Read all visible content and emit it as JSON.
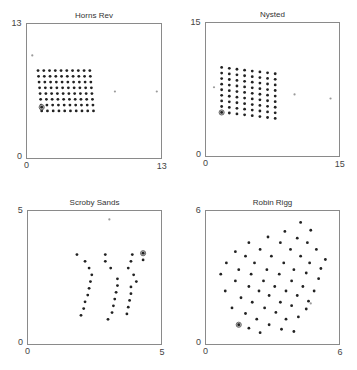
{
  "chart_data": [
    {
      "type": "scatter",
      "title": "Horns Rev",
      "xlabel": "",
      "ylabel": "",
      "xlim": [
        0,
        13
      ],
      "ylim": [
        0,
        13
      ],
      "xticks": [
        "0",
        "13"
      ],
      "yticks": [
        "0",
        "13"
      ],
      "grid": false,
      "box": {
        "left": 26,
        "top": 23,
        "size": 136
      },
      "series": [
        {
          "name": "turbines",
          "color": "#222222",
          "generator": {
            "rows": 8,
            "cols": 10,
            "x0": 1.15,
            "y0": 8.45,
            "dx": 0.55,
            "dy": -0.55,
            "row_shift": 0.05
          }
        },
        {
          "name": "highlighted turbine",
          "color": "#222222",
          "points": [
            [
              1.5,
              4.95
            ]
          ],
          "ring": true
        },
        {
          "name": "reference points",
          "color": "#9a9a9a",
          "points": [
            [
              0.6,
              9.9
            ],
            [
              8.5,
              6.45
            ],
            [
              12.5,
              6.45
            ]
          ]
        }
      ]
    },
    {
      "type": "scatter",
      "title": "Nysted",
      "xlabel": "",
      "ylabel": "",
      "xlim": [
        0,
        15
      ],
      "ylim": [
        0,
        15
      ],
      "xticks": [
        "0",
        "15"
      ],
      "yticks": [
        "0",
        "15"
      ],
      "grid": false,
      "box": {
        "left": 205,
        "top": 22,
        "size": 135
      },
      "series": [
        {
          "name": "turbines",
          "color": "#222222",
          "generator": {
            "rows": 9,
            "cols": 8,
            "x0": 1.85,
            "y0": 9.95,
            "dx": 0.85,
            "dy": -0.62,
            "col_shift": -0.1
          }
        },
        {
          "name": "highlighted turbine",
          "color": "#222222",
          "points": [
            [
              1.85,
              4.95
            ]
          ],
          "ring": true
        },
        {
          "name": "reference points",
          "color": "#9a9a9a",
          "points": [
            [
              1.0,
              7.75
            ],
            [
              9.95,
              6.95
            ],
            [
              13.95,
              6.5
            ]
          ]
        }
      ]
    },
    {
      "type": "scatter",
      "title": "Scroby Sands",
      "xlabel": "",
      "ylabel": "",
      "xlim": [
        0,
        5
      ],
      "ylim": [
        0,
        5
      ],
      "xticks": [
        "0",
        "5"
      ],
      "yticks": [
        "0",
        "5"
      ],
      "grid": false,
      "box": {
        "left": 27,
        "top": 210,
        "size": 135
      },
      "series": [
        {
          "name": "turbines",
          "color": "#222222",
          "points": [
            [
              1.85,
              3.35
            ],
            [
              2.15,
              3.1
            ],
            [
              2.3,
              2.85
            ],
            [
              2.4,
              2.6
            ],
            [
              2.35,
              2.35
            ],
            [
              2.3,
              2.1
            ],
            [
              2.25,
              1.85
            ],
            [
              2.15,
              1.6
            ],
            [
              2.1,
              1.35
            ],
            [
              2.0,
              1.1
            ],
            [
              2.9,
              3.35
            ],
            [
              2.9,
              3.1
            ],
            [
              3.1,
              2.85
            ],
            [
              3.35,
              2.45
            ],
            [
              3.35,
              2.2
            ],
            [
              3.3,
              1.95
            ],
            [
              3.25,
              1.7
            ],
            [
              3.2,
              1.45
            ],
            [
              3.15,
              1.2
            ],
            [
              3.0,
              0.95
            ],
            [
              3.9,
              3.35
            ],
            [
              3.85,
              3.1
            ],
            [
              3.75,
              2.85
            ],
            [
              3.95,
              2.6
            ],
            [
              4.05,
              2.35
            ],
            [
              3.85,
              2.15
            ],
            [
              3.85,
              1.9
            ],
            [
              3.8,
              1.65
            ],
            [
              3.75,
              1.4
            ],
            [
              3.7,
              1.15
            ],
            [
              4.3,
              3.15
            ]
          ]
        },
        {
          "name": "highlighted turbine",
          "color": "#222222",
          "points": [
            [
              4.3,
              3.4
            ]
          ],
          "ring": true
        },
        {
          "name": "reference points",
          "color": "#9a9a9a",
          "points": [
            [
              3.05,
              4.65
            ]
          ]
        }
      ]
    },
    {
      "type": "scatter",
      "title": "Robin Rigg",
      "xlabel": "",
      "ylabel": "",
      "xlim": [
        0,
        6
      ],
      "ylim": [
        0,
        6
      ],
      "xticks": [
        "0",
        "6"
      ],
      "yticks": [
        "0",
        "6"
      ],
      "grid": false,
      "box": {
        "left": 205,
        "top": 210,
        "size": 135
      },
      "series": [
        {
          "name": "turbines",
          "color": "#222222",
          "points": [
            [
              4.25,
              5.45
            ],
            [
              4.7,
              5.1
            ],
            [
              3.55,
              5.05
            ],
            [
              4.1,
              4.75
            ],
            [
              2.8,
              4.8
            ],
            [
              3.35,
              4.55
            ],
            [
              4.55,
              4.55
            ],
            [
              1.95,
              4.55
            ],
            [
              2.45,
              4.25
            ],
            [
              3.8,
              4.25
            ],
            [
              4.95,
              4.25
            ],
            [
              1.35,
              4.15
            ],
            [
              1.8,
              3.95
            ],
            [
              2.95,
              3.95
            ],
            [
              4.25,
              3.95
            ],
            [
              5.35,
              3.8
            ],
            [
              0.95,
              3.65
            ],
            [
              2.2,
              3.65
            ],
            [
              3.5,
              3.65
            ],
            [
              4.65,
              3.65
            ],
            [
              5.15,
              3.4
            ],
            [
              1.5,
              3.35
            ],
            [
              2.75,
              3.35
            ],
            [
              3.95,
              3.35
            ],
            [
              0.7,
              3.15
            ],
            [
              2.05,
              3.15
            ],
            [
              3.3,
              3.15
            ],
            [
              4.5,
              3.2
            ],
            [
              5.05,
              2.95
            ],
            [
              1.35,
              2.85
            ],
            [
              2.6,
              2.85
            ],
            [
              3.85,
              2.85
            ],
            [
              1.95,
              2.6
            ],
            [
              3.1,
              2.6
            ],
            [
              4.35,
              2.6
            ],
            [
              0.9,
              2.4
            ],
            [
              2.4,
              2.4
            ],
            [
              3.6,
              2.4
            ],
            [
              4.85,
              2.4
            ],
            [
              1.6,
              2.1
            ],
            [
              2.85,
              2.2
            ],
            [
              4.1,
              2.2
            ],
            [
              4.6,
              1.95
            ],
            [
              2.1,
              1.9
            ],
            [
              3.35,
              1.9
            ],
            [
              1.2,
              1.65
            ],
            [
              2.65,
              1.65
            ],
            [
              3.85,
              1.75
            ],
            [
              4.5,
              1.6
            ],
            [
              1.8,
              1.4
            ],
            [
              3.15,
              1.45
            ],
            [
              4.15,
              1.25
            ],
            [
              2.3,
              1.15
            ],
            [
              3.6,
              1.15
            ],
            [
              2.85,
              0.9
            ],
            [
              1.95,
              0.75
            ],
            [
              3.4,
              0.7
            ],
            [
              2.45,
              0.55
            ],
            [
              3.95,
              0.6
            ]
          ]
        },
        {
          "name": "highlighted turbine",
          "color": "#222222",
          "points": [
            [
              1.5,
              0.9
            ]
          ],
          "ring": true
        },
        {
          "name": "reference points",
          "color": "#9a9a9a",
          "points": [
            [
              4.7,
              1.85
            ]
          ]
        }
      ]
    }
  ]
}
